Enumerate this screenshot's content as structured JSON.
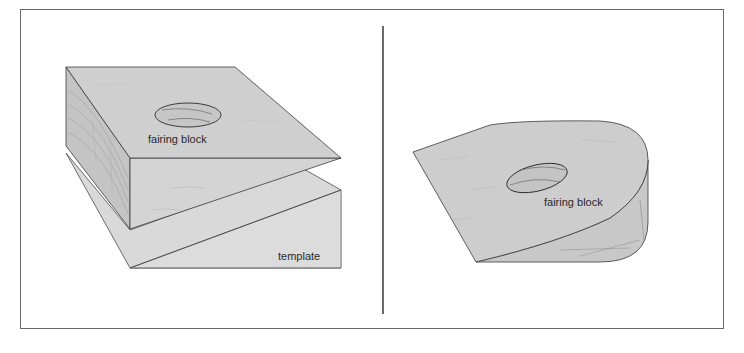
{
  "figure": {
    "panels": [
      {
        "id": "left",
        "labels": {
          "block": "fairing block",
          "template": "template"
        }
      },
      {
        "id": "right",
        "labels": {
          "block": "fairing block"
        }
      }
    ]
  },
  "colors": {
    "border": "#6a6a6a",
    "face_top": "#cfcfcf",
    "face_side": "#c4c4c4",
    "face_front": "#d6d6d6",
    "template": "#d9d9d9",
    "line": "#3a3a3a",
    "grain": "#9a9a9a",
    "text": "#2a2a2a"
  }
}
